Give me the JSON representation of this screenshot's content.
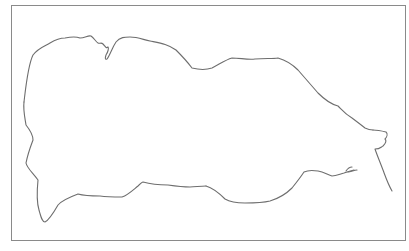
{
  "drawing": {
    "description": "hand-drawn outline sketch inside a rectangular frame",
    "stroke_color": "#6e6e6e",
    "frame_color": "#8a8a8a",
    "background": "#ffffff"
  }
}
